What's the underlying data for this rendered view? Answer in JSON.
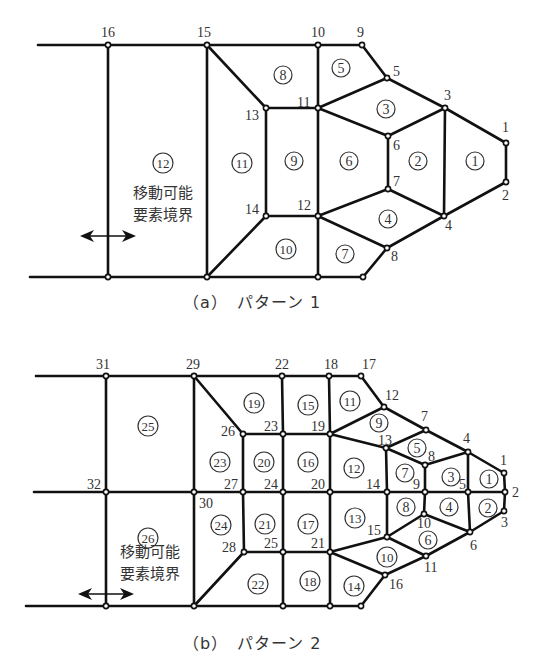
{
  "style": {
    "line_color": "#111111",
    "text_color": "#333333",
    "background": "#ffffff"
  },
  "pattern_a": {
    "caption": "（a）　パターン 1",
    "label": "移動可能\n要素境界",
    "label_lines": [
      "移動可能",
      "要素境界"
    ],
    "nodes": {
      "1": [
        506,
        143
      ],
      "2": [
        506,
        182
      ],
      "3": [
        445,
        108
      ],
      "4": [
        444,
        216
      ],
      "5": [
        387,
        78
      ],
      "6": [
        388,
        136
      ],
      "7": [
        388,
        189
      ],
      "8": [
        387,
        248
      ],
      "9": [
        362,
        45
      ],
      "10": [
        318,
        45
      ],
      "11": [
        318,
        108
      ],
      "12": [
        318,
        216
      ],
      "13": [
        266,
        108
      ],
      "14": [
        266,
        216
      ],
      "15": [
        207,
        45
      ],
      "16": [
        108,
        45
      ],
      "b17": [
        318,
        277
      ],
      "b18": [
        363,
        277
      ],
      "b15": [
        207,
        277
      ],
      "b16": [
        108,
        277
      ]
    },
    "labeled_nodes": [
      "1",
      "2",
      "3",
      "4",
      "5",
      "6",
      "7",
      "8",
      "9",
      "10",
      "11",
      "12",
      "13",
      "14",
      "15",
      "16"
    ],
    "node_label_pos": {
      "1": [
        502,
        132
      ],
      "2": [
        502,
        200
      ],
      "3": [
        444,
        100
      ],
      "4": [
        445,
        230
      ],
      "5": [
        393,
        76
      ],
      "6": [
        393,
        150
      ],
      "7": [
        393,
        186
      ],
      "8": [
        391,
        261
      ],
      "9": [
        357,
        37
      ],
      "10": [
        311,
        37
      ],
      "11": [
        297,
        107
      ],
      "12": [
        297,
        210
      ],
      "13": [
        245,
        120
      ],
      "14": [
        245,
        214
      ],
      "15": [
        197,
        37
      ],
      "16": [
        101,
        37
      ]
    },
    "edges": [
      [
        "L0",
        "16"
      ],
      [
        "16",
        "15"
      ],
      [
        "15",
        "10"
      ],
      [
        "10",
        "9"
      ],
      [
        "9",
        "5"
      ],
      [
        "5",
        "3"
      ],
      [
        "3",
        "1"
      ],
      [
        "1",
        "2"
      ],
      [
        "2",
        "4"
      ],
      [
        "4",
        "8"
      ],
      [
        "8",
        "b18"
      ],
      [
        "b18",
        "b17"
      ],
      [
        "b17",
        "b15"
      ],
      [
        "b15",
        "b16"
      ],
      [
        "b16",
        "L1"
      ],
      [
        "16",
        "b16"
      ],
      [
        "15",
        "b15"
      ],
      [
        "15",
        "13"
      ],
      [
        "13",
        "14"
      ],
      [
        "14",
        "b15"
      ],
      [
        "13",
        "11"
      ],
      [
        "14",
        "12"
      ],
      [
        "10",
        "11"
      ],
      [
        "11",
        "12"
      ],
      [
        "12",
        "b17"
      ],
      [
        "11",
        "5"
      ],
      [
        "11",
        "6"
      ],
      [
        "6",
        "3"
      ],
      [
        "6",
        "7"
      ],
      [
        "3",
        "4"
      ],
      [
        "12",
        "7"
      ],
      [
        "7",
        "4"
      ],
      [
        "12",
        "8"
      ]
    ],
    "left_ends": {
      "L0": [
        38,
        45
      ],
      "L1": [
        30,
        277
      ]
    },
    "elements": [
      {
        "id": "1",
        "pos": [
          475,
          161
        ]
      },
      {
        "id": "2",
        "pos": [
          418,
          161
        ]
      },
      {
        "id": "3",
        "pos": [
          386,
          109
        ]
      },
      {
        "id": "4",
        "pos": [
          388,
          219
        ]
      },
      {
        "id": "5",
        "pos": [
          341,
          68
        ]
      },
      {
        "id": "6",
        "pos": [
          349,
          161
        ]
      },
      {
        "id": "7",
        "pos": [
          345,
          254
        ]
      },
      {
        "id": "8",
        "pos": [
          283,
          75
        ]
      },
      {
        "id": "9",
        "pos": [
          294,
          161
        ]
      },
      {
        "id": "10",
        "pos": [
          286,
          249
        ]
      },
      {
        "id": "11",
        "pos": [
          242,
          163
        ]
      },
      {
        "id": "12",
        "pos": [
          163,
          163
        ]
      }
    ],
    "label_pos": [
      163,
      198
    ],
    "arrow": {
      "x1": 80,
      "x2": 136,
      "y": 236
    }
  },
  "pattern_b": {
    "caption": "（b）　パターン 2",
    "label_lines": [
      "移動可能",
      "要素境界"
    ],
    "nodes": {
      "1": [
        504,
        473
      ],
      "2": [
        505,
        492
      ],
      "3": [
        504,
        511
      ],
      "4": [
        468,
        452
      ],
      "5": [
        468,
        492
      ],
      "6": [
        470,
        532
      ],
      "7": [
        426,
        430
      ],
      "8": [
        425,
        465
      ],
      "9": [
        425,
        492
      ],
      "10": [
        424,
        514
      ],
      "11": [
        426,
        556
      ],
      "12": [
        384,
        407
      ],
      "13": [
        386,
        448
      ],
      "14": [
        387,
        492
      ],
      "15": [
        387,
        537
      ],
      "16": [
        385,
        575
      ],
      "17": [
        361,
        376
      ],
      "18": [
        329,
        376
      ],
      "19": [
        330,
        434
      ],
      "20": [
        330,
        492
      ],
      "21": [
        330,
        552
      ],
      "22": [
        282,
        376
      ],
      "23": [
        283,
        434
      ],
      "24": [
        283,
        492
      ],
      "25": [
        283,
        552
      ],
      "26": [
        243,
        434
      ],
      "27": [
        243,
        492
      ],
      "28": [
        244,
        552
      ],
      "29": [
        194,
        376
      ],
      "30": [
        194,
        492
      ],
      "31": [
        106,
        376
      ],
      "32": [
        106,
        492
      ],
      "b1": [
        361,
        606
      ],
      "b2": [
        330,
        606
      ],
      "b3": [
        283,
        606
      ],
      "b4": [
        194,
        606
      ],
      "b5": [
        106,
        606
      ]
    },
    "labeled_nodes": [
      "1",
      "2",
      "3",
      "4",
      "5",
      "6",
      "7",
      "8",
      "9",
      "10",
      "11",
      "12",
      "13",
      "14",
      "15",
      "16",
      "17",
      "18",
      "19",
      "20",
      "21",
      "22",
      "23",
      "24",
      "25",
      "26",
      "27",
      "28",
      "29",
      "30",
      "31",
      "32"
    ],
    "node_label_pos": {
      "1": [
        500,
        465
      ],
      "2": [
        512,
        497
      ],
      "3": [
        501,
        527
      ],
      "4": [
        463,
        443
      ],
      "5": [
        459,
        489
      ],
      "6": [
        470,
        550
      ],
      "7": [
        421,
        421
      ],
      "8": [
        428,
        461
      ],
      "9": [
        413,
        489
      ],
      "10": [
        417,
        528
      ],
      "11": [
        424,
        572
      ],
      "12": [
        385,
        400
      ],
      "13": [
        378,
        445
      ],
      "14": [
        366,
        489
      ],
      "15": [
        367,
        535
      ],
      "16": [
        389,
        589
      ],
      "17": [
        362,
        369
      ],
      "18": [
        324,
        369
      ],
      "19": [
        311,
        431
      ],
      "20": [
        311,
        489
      ],
      "21": [
        311,
        548
      ],
      "22": [
        275,
        369
      ],
      "23": [
        264,
        431
      ],
      "24": [
        264,
        489
      ],
      "25": [
        264,
        548
      ],
      "26": [
        221,
        436
      ],
      "27": [
        224,
        489
      ],
      "28": [
        222,
        552
      ],
      "29": [
        186,
        369
      ],
      "30": [
        199,
        508
      ],
      "31": [
        96,
        369
      ],
      "32": [
        87,
        489
      ]
    },
    "edges": [
      [
        "L0",
        "31"
      ],
      [
        "31",
        "29"
      ],
      [
        "29",
        "22"
      ],
      [
        "22",
        "18"
      ],
      [
        "18",
        "17"
      ],
      [
        "17",
        "12"
      ],
      [
        "12",
        "7"
      ],
      [
        "7",
        "4"
      ],
      [
        "4",
        "1"
      ],
      [
        "1",
        "2"
      ],
      [
        "2",
        "3"
      ],
      [
        "3",
        "6"
      ],
      [
        "6",
        "11"
      ],
      [
        "11",
        "16"
      ],
      [
        "16",
        "b1"
      ],
      [
        "b1",
        "b2"
      ],
      [
        "b2",
        "b3"
      ],
      [
        "b3",
        "b4"
      ],
      [
        "b4",
        "b5"
      ],
      [
        "b5",
        "L2"
      ],
      [
        "L1",
        "32"
      ],
      [
        "32",
        "30"
      ],
      [
        "30",
        "27"
      ],
      [
        "27",
        "24"
      ],
      [
        "24",
        "20"
      ],
      [
        "20",
        "14"
      ],
      [
        "14",
        "9"
      ],
      [
        "9",
        "5"
      ],
      [
        "5",
        "2"
      ],
      [
        "31",
        "32"
      ],
      [
        "32",
        "b5"
      ],
      [
        "29",
        "30"
      ],
      [
        "30",
        "b4"
      ],
      [
        "29",
        "26"
      ],
      [
        "26",
        "27"
      ],
      [
        "27",
        "28"
      ],
      [
        "28",
        "b4"
      ],
      [
        "26",
        "23"
      ],
      [
        "23",
        "19"
      ],
      [
        "28",
        "25"
      ],
      [
        "25",
        "21"
      ],
      [
        "22",
        "23"
      ],
      [
        "23",
        "24"
      ],
      [
        "24",
        "25"
      ],
      [
        "25",
        "b3"
      ],
      [
        "18",
        "19"
      ],
      [
        "19",
        "20"
      ],
      [
        "20",
        "21"
      ],
      [
        "21",
        "b2"
      ],
      [
        "19",
        "12"
      ],
      [
        "19",
        "13"
      ],
      [
        "13",
        "7"
      ],
      [
        "13",
        "8"
      ],
      [
        "8",
        "4"
      ],
      [
        "13",
        "14"
      ],
      [
        "14",
        "15"
      ],
      [
        "21",
        "15"
      ],
      [
        "15",
        "10"
      ],
      [
        "10",
        "6"
      ],
      [
        "21",
        "16"
      ],
      [
        "15",
        "11"
      ],
      [
        "8",
        "9"
      ],
      [
        "9",
        "10"
      ],
      [
        "4",
        "5"
      ],
      [
        "5",
        "6"
      ]
    ],
    "left_ends": {
      "L0": [
        36,
        376
      ],
      "L1": [
        34,
        492
      ],
      "L2": [
        26,
        606
      ]
    },
    "elements": [
      {
        "id": "1",
        "pos": [
          489,
          479
        ]
      },
      {
        "id": "2",
        "pos": [
          488,
          508
        ]
      },
      {
        "id": "3",
        "pos": [
          451,
          477
        ]
      },
      {
        "id": "4",
        "pos": [
          449,
          507
        ]
      },
      {
        "id": "5",
        "pos": [
          417,
          448
        ]
      },
      {
        "id": "6",
        "pos": [
          428,
          540
        ]
      },
      {
        "id": "7",
        "pos": [
          405,
          473
        ]
      },
      {
        "id": "8",
        "pos": [
          406,
          507
        ]
      },
      {
        "id": "9",
        "pos": [
          379,
          423
        ]
      },
      {
        "id": "10",
        "pos": [
          387,
          557
        ]
      },
      {
        "id": "11",
        "pos": [
          350,
          401
        ]
      },
      {
        "id": "12",
        "pos": [
          354,
          468
        ]
      },
      {
        "id": "13",
        "pos": [
          355,
          518
        ]
      },
      {
        "id": "14",
        "pos": [
          354,
          586
        ]
      },
      {
        "id": "15",
        "pos": [
          308,
          405
        ]
      },
      {
        "id": "16",
        "pos": [
          308,
          462
        ]
      },
      {
        "id": "17",
        "pos": [
          308,
          524
        ]
      },
      {
        "id": "18",
        "pos": [
          310,
          581
        ]
      },
      {
        "id": "19",
        "pos": [
          254,
          403
        ]
      },
      {
        "id": "20",
        "pos": [
          264,
          462
        ]
      },
      {
        "id": "21",
        "pos": [
          265,
          524
        ]
      },
      {
        "id": "22",
        "pos": [
          258,
          584
        ]
      },
      {
        "id": "23",
        "pos": [
          220,
          462
        ]
      },
      {
        "id": "24",
        "pos": [
          221,
          525
        ]
      },
      {
        "id": "25",
        "pos": [
          148,
          426
        ]
      },
      {
        "id": "26",
        "pos": [
          148,
          538
        ]
      }
    ],
    "label_pos": [
      150,
      557
    ],
    "arrow": {
      "x1": 78,
      "x2": 134,
      "y": 594
    }
  }
}
